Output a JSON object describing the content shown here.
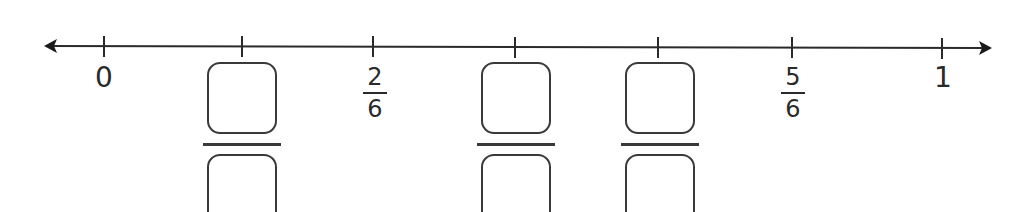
{
  "diagram": {
    "type": "number_line",
    "range": [
      0,
      1
    ],
    "denominator": 6,
    "line_color": "#2a2a2a",
    "ticks": [
      {
        "x": 104,
        "value": "0",
        "kind": "whole",
        "label": "0"
      },
      {
        "x": 242,
        "value": "1/6",
        "kind": "blank"
      },
      {
        "x": 373,
        "value": "2/6",
        "kind": "fraction",
        "numerator": "2",
        "denominator": "6"
      },
      {
        "x": 515,
        "value": "3/6",
        "kind": "blank"
      },
      {
        "x": 658,
        "value": "4/6",
        "kind": "blank"
      },
      {
        "x": 792,
        "value": "5/6",
        "kind": "fraction",
        "numerator": "5",
        "denominator": "6"
      },
      {
        "x": 942,
        "value": "1",
        "kind": "whole",
        "label": "1"
      }
    ]
  },
  "labels": {
    "zero": "0",
    "one": "1",
    "two_sixths": {
      "numerator": "2",
      "denominator": "6"
    },
    "five_sixths": {
      "numerator": "5",
      "denominator": "6"
    }
  }
}
